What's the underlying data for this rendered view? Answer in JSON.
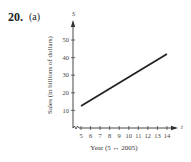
{
  "problem": {
    "number": "20.",
    "part": "(a)"
  },
  "chart_data": {
    "type": "line",
    "title": "",
    "xlabel": "Year (5 ↔ 2005)",
    "ylabel": "Sales (in billions of dollars)",
    "x_axis_var": "t",
    "y_axis_var": "S",
    "x_ticks": [
      5,
      6,
      7,
      8,
      9,
      10,
      11,
      12,
      13,
      14
    ],
    "y_ticks": [
      10,
      20,
      30,
      40,
      50
    ],
    "xlim": [
      4,
      15
    ],
    "ylim": [
      0,
      55
    ],
    "x_axis_break": true,
    "grid": false,
    "legend": null,
    "series": [
      {
        "name": "S",
        "x": [
          5,
          14
        ],
        "values": [
          12.5,
          42
        ]
      }
    ],
    "line_color": "#222222"
  }
}
